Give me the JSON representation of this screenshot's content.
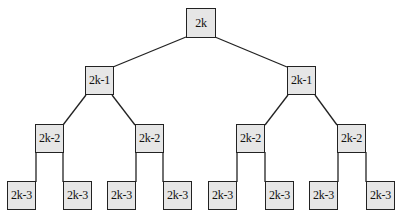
{
  "diagram": {
    "type": "binary-tree",
    "colors": {
      "node_fill": "#e6e6e6",
      "node_border": "#222222",
      "edge": "#222222",
      "background": "#ffffff"
    },
    "levels": [
      {
        "label": "2k",
        "nodes": [
          {
            "id": "n0",
            "x": 186,
            "y": 8
          }
        ]
      },
      {
        "label": "2k-1",
        "nodes": [
          {
            "id": "n1",
            "x": 85,
            "y": 66
          },
          {
            "id": "n2",
            "x": 287,
            "y": 66
          }
        ]
      },
      {
        "label": "2k-2",
        "nodes": [
          {
            "id": "n3",
            "x": 35,
            "y": 124
          },
          {
            "id": "n4",
            "x": 135,
            "y": 124
          },
          {
            "id": "n5",
            "x": 236,
            "y": 124
          },
          {
            "id": "n6",
            "x": 337,
            "y": 124
          }
        ]
      },
      {
        "label": "2k-3",
        "nodes": [
          {
            "id": "n7",
            "x": 7,
            "y": 181
          },
          {
            "id": "n8",
            "x": 63,
            "y": 181
          },
          {
            "id": "n9",
            "x": 107,
            "y": 181
          },
          {
            "id": "n10",
            "x": 163,
            "y": 181
          },
          {
            "id": "n11",
            "x": 208,
            "y": 181
          },
          {
            "id": "n12",
            "x": 265,
            "y": 181
          },
          {
            "id": "n13",
            "x": 309,
            "y": 181
          },
          {
            "id": "n14",
            "x": 366,
            "y": 181
          }
        ]
      }
    ],
    "nodes": {
      "root": "2k",
      "l1_left": "2k-1",
      "l1_right": "2k-1",
      "l2_1": "2k-2",
      "l2_2": "2k-2",
      "l2_3": "2k-2",
      "l2_4": "2k-2",
      "l3_1": "2k-3",
      "l3_2": "2k-3",
      "l3_3": "2k-3",
      "l3_4": "2k-3",
      "l3_5": "2k-3",
      "l3_6": "2k-3",
      "l3_7": "2k-3",
      "l3_8": "2k-3"
    }
  }
}
